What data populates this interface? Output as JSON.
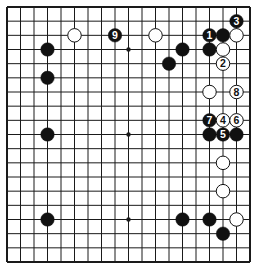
{
  "diagram": {
    "type": "go-board",
    "size": 19,
    "geometry": {
      "left": 7,
      "top": 7,
      "right": 250,
      "bottom": 262
    },
    "colors": {
      "line": "#1a1a1a",
      "black_stone": "#111111",
      "white_stone": "#ffffff",
      "background": "#ffffff"
    },
    "star_points": [
      [
        9,
        3
      ],
      [
        9,
        9
      ],
      [
        9,
        15
      ],
      [
        3,
        3
      ],
      [
        3,
        9
      ],
      [
        3,
        15
      ],
      [
        15,
        3
      ],
      [
        15,
        9
      ],
      [
        15,
        15
      ]
    ],
    "stones": [
      {
        "col": 5,
        "row": 2,
        "color": "white",
        "label": ""
      },
      {
        "col": 8,
        "row": 2,
        "color": "black",
        "label": "9"
      },
      {
        "col": 11,
        "row": 2,
        "color": "white",
        "label": ""
      },
      {
        "col": 15,
        "row": 2,
        "color": "black",
        "label": "1"
      },
      {
        "col": 16,
        "row": 2,
        "color": "black",
        "label": ""
      },
      {
        "col": 17,
        "row": 2,
        "color": "white",
        "label": ""
      },
      {
        "col": 17,
        "row": 1,
        "color": "black",
        "label": "3"
      },
      {
        "col": 3,
        "row": 3,
        "color": "black",
        "label": ""
      },
      {
        "col": 13,
        "row": 3,
        "color": "black",
        "label": ""
      },
      {
        "col": 15,
        "row": 3,
        "color": "black",
        "label": ""
      },
      {
        "col": 16,
        "row": 3,
        "color": "white",
        "label": ""
      },
      {
        "col": 12,
        "row": 4,
        "color": "black",
        "label": ""
      },
      {
        "col": 16,
        "row": 4,
        "color": "white",
        "label": "2"
      },
      {
        "col": 3,
        "row": 5,
        "color": "black",
        "label": ""
      },
      {
        "col": 15,
        "row": 6,
        "color": "white",
        "label": ""
      },
      {
        "col": 17,
        "row": 6,
        "color": "white",
        "label": "8"
      },
      {
        "col": 15,
        "row": 8,
        "color": "black",
        "label": "7"
      },
      {
        "col": 16,
        "row": 8,
        "color": "white",
        "label": "4"
      },
      {
        "col": 17,
        "row": 8,
        "color": "white",
        "label": "6"
      },
      {
        "col": 3,
        "row": 9,
        "color": "black",
        "label": ""
      },
      {
        "col": 15,
        "row": 9,
        "color": "black",
        "label": ""
      },
      {
        "col": 16,
        "row": 9,
        "color": "black",
        "label": "5"
      },
      {
        "col": 17,
        "row": 9,
        "color": "black",
        "label": ""
      },
      {
        "col": 16,
        "row": 11,
        "color": "white",
        "label": ""
      },
      {
        "col": 16,
        "row": 13,
        "color": "white",
        "label": ""
      },
      {
        "col": 3,
        "row": 15,
        "color": "black",
        "label": ""
      },
      {
        "col": 13,
        "row": 15,
        "color": "black",
        "label": ""
      },
      {
        "col": 15,
        "row": 15,
        "color": "black",
        "label": ""
      },
      {
        "col": 17,
        "row": 15,
        "color": "white",
        "label": ""
      },
      {
        "col": 16,
        "row": 16,
        "color": "black",
        "label": ""
      }
    ]
  }
}
